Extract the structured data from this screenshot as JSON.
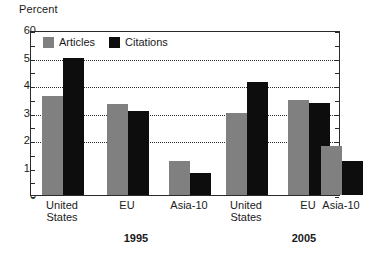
{
  "chart_data": {
    "type": "bar",
    "title": "",
    "subtitle": "",
    "xlabel": "",
    "ylabel": "Percent",
    "ylim": [
      0,
      60
    ],
    "yticks": [
      0,
      10,
      20,
      30,
      40,
      50,
      60
    ],
    "ytick_labels": [
      "0",
      "10",
      "20",
      "30",
      "40",
      "50",
      "60"
    ],
    "gridlines": [
      20,
      30,
      40,
      50
    ],
    "grid": true,
    "legend_position": "top-left",
    "categories": [
      "United\nStates",
      "EU",
      "Asia-10",
      "United\nStates",
      "EU",
      "Asia-10"
    ],
    "groups": [
      {
        "label": "1995",
        "categories": [
          "United\nStates",
          "EU",
          "Asia-10"
        ]
      },
      {
        "label": "2005",
        "categories": [
          "United\nStates",
          "EU",
          "Asia-10"
        ]
      }
    ],
    "series": [
      {
        "name": "Articles",
        "color": "#808080",
        "values": [
          36,
          33,
          12.5,
          30,
          34.5,
          18
        ]
      },
      {
        "name": "Citations",
        "color": "#0d0d0d",
        "values": [
          50,
          30.5,
          8,
          41,
          33.5,
          12.5
        ]
      }
    ]
  },
  "legend": {
    "items": [
      {
        "label": "Articles",
        "color": "#808080"
      },
      {
        "label": "Citations",
        "color": "#0d0d0d"
      }
    ]
  },
  "axis": {
    "unit_label": "Percent"
  },
  "colors": {
    "articles": "#808080",
    "citations": "#0d0d0d",
    "frame": "#2b2b2b",
    "grid": "#2f2f2f",
    "background": "#ffffff"
  }
}
